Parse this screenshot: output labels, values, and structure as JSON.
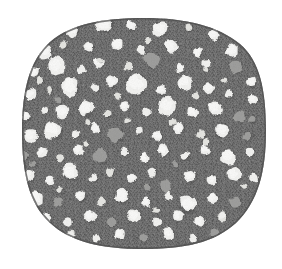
{
  "figure": {
    "title": "Grayscale micrograph of a rounded specimen section",
    "background_color": "#ffffff",
    "canvas": {
      "width": 282,
      "height": 269
    }
  },
  "specimen": {
    "name": "specimen-body",
    "matrix_color": "#6f6f6f",
    "matrix_color_dark": "#5e5e5e",
    "matrix_color_light": "#7e7e7e",
    "edge_color": "#4d4d4d",
    "bounds": {
      "left": 22,
      "top": 18,
      "right": 266,
      "bottom": 249
    },
    "shape": "rounded-squircle",
    "texture": "fine-crosshatch-halftone-grain"
  },
  "legend_colors": {
    "inclusion_white": "#f2f2f0",
    "inclusion_offwhite": "#e4e4e0",
    "inclusion_gray": "#9e9e9c",
    "inclusion_gray_dark": "#8a8a88",
    "matrix": "#6f6f6f"
  },
  "chart_data": {
    "type": "scatter",
    "title": "Grayscale micrograph of a rounded specimen section",
    "subtitle": "",
    "xlabel": "",
    "ylabel": "",
    "xlim": [
      0,
      282
    ],
    "ylim": [
      0,
      269
    ],
    "grid": false,
    "legend_position": "none",
    "classes": [
      {
        "name": "white",
        "color": "#f2f2f0",
        "count": 96
      },
      {
        "name": "offwhite",
        "color": "#e4e4e0",
        "count": 22
      },
      {
        "name": "gray",
        "color": "#9e9e9c",
        "count": 21
      }
    ],
    "points": [
      {
        "x": 72,
        "y": 30,
        "r": 7.5,
        "class": "white"
      },
      {
        "x": 104,
        "y": 24,
        "r": 9.0,
        "class": "white"
      },
      {
        "x": 131,
        "y": 26,
        "r": 5.0,
        "class": "white"
      },
      {
        "x": 160,
        "y": 29,
        "r": 8.0,
        "class": "white"
      },
      {
        "x": 188,
        "y": 27,
        "r": 4.0,
        "class": "offwhite"
      },
      {
        "x": 214,
        "y": 35,
        "r": 5.5,
        "class": "white"
      },
      {
        "x": 45,
        "y": 52,
        "r": 7.0,
        "class": "white"
      },
      {
        "x": 64,
        "y": 45,
        "r": 4.0,
        "class": "offwhite"
      },
      {
        "x": 89,
        "y": 47,
        "r": 5.0,
        "class": "white"
      },
      {
        "x": 117,
        "y": 44,
        "r": 6.0,
        "class": "white"
      },
      {
        "x": 141,
        "y": 50,
        "r": 4.5,
        "class": "white"
      },
      {
        "x": 171,
        "y": 46,
        "r": 7.5,
        "class": "white"
      },
      {
        "x": 198,
        "y": 52,
        "r": 5.0,
        "class": "white"
      },
      {
        "x": 232,
        "y": 50,
        "r": 6.5,
        "class": "white"
      },
      {
        "x": 34,
        "y": 72,
        "r": 5.5,
        "class": "white"
      },
      {
        "x": 56,
        "y": 66,
        "r": 9.5,
        "class": "white"
      },
      {
        "x": 82,
        "y": 70,
        "r": 4.0,
        "class": "white"
      },
      {
        "x": 99,
        "y": 62,
        "r": 5.5,
        "class": "white"
      },
      {
        "x": 128,
        "y": 66,
        "r": 4.5,
        "class": "offwhite"
      },
      {
        "x": 152,
        "y": 60,
        "r": 8.5,
        "class": "gray"
      },
      {
        "x": 180,
        "y": 68,
        "r": 5.0,
        "class": "white"
      },
      {
        "x": 206,
        "y": 63,
        "r": 4.5,
        "class": "white"
      },
      {
        "x": 236,
        "y": 67,
        "r": 7.0,
        "class": "gray"
      },
      {
        "x": 252,
        "y": 82,
        "r": 5.0,
        "class": "white"
      },
      {
        "x": 30,
        "y": 94,
        "r": 6.0,
        "class": "white"
      },
      {
        "x": 50,
        "y": 90,
        "r": 4.0,
        "class": "offwhite"
      },
      {
        "x": 70,
        "y": 86,
        "r": 10.0,
        "class": "white"
      },
      {
        "x": 95,
        "y": 88,
        "r": 4.5,
        "class": "white"
      },
      {
        "x": 112,
        "y": 82,
        "r": 5.5,
        "class": "white"
      },
      {
        "x": 136,
        "y": 84,
        "r": 11.0,
        "class": "white"
      },
      {
        "x": 161,
        "y": 90,
        "r": 5.0,
        "class": "white"
      },
      {
        "x": 185,
        "y": 83,
        "r": 7.0,
        "class": "white"
      },
      {
        "x": 209,
        "y": 88,
        "r": 5.5,
        "class": "white"
      },
      {
        "x": 229,
        "y": 94,
        "r": 4.5,
        "class": "white"
      },
      {
        "x": 253,
        "y": 100,
        "r": 5.5,
        "class": "white"
      },
      {
        "x": 26,
        "y": 116,
        "r": 5.0,
        "class": "white"
      },
      {
        "x": 45,
        "y": 110,
        "r": 4.0,
        "class": "white"
      },
      {
        "x": 62,
        "y": 112,
        "r": 6.5,
        "class": "white"
      },
      {
        "x": 86,
        "y": 108,
        "r": 8.0,
        "class": "white"
      },
      {
        "x": 108,
        "y": 114,
        "r": 4.0,
        "class": "offwhite"
      },
      {
        "x": 124,
        "y": 106,
        "r": 5.0,
        "class": "white"
      },
      {
        "x": 146,
        "y": 112,
        "r": 4.5,
        "class": "white"
      },
      {
        "x": 167,
        "y": 106,
        "r": 9.0,
        "class": "white"
      },
      {
        "x": 192,
        "y": 112,
        "r": 5.5,
        "class": "white"
      },
      {
        "x": 215,
        "y": 108,
        "r": 7.5,
        "class": "white"
      },
      {
        "x": 240,
        "y": 116,
        "r": 6.5,
        "class": "gray"
      },
      {
        "x": 31,
        "y": 136,
        "r": 7.0,
        "class": "white"
      },
      {
        "x": 53,
        "y": 130,
        "r": 9.0,
        "class": "white"
      },
      {
        "x": 76,
        "y": 134,
        "r": 4.5,
        "class": "white"
      },
      {
        "x": 96,
        "y": 128,
        "r": 5.5,
        "class": "white"
      },
      {
        "x": 116,
        "y": 134,
        "r": 8.5,
        "class": "gray"
      },
      {
        "x": 139,
        "y": 130,
        "r": 4.0,
        "class": "white"
      },
      {
        "x": 158,
        "y": 136,
        "r": 5.0,
        "class": "white"
      },
      {
        "x": 179,
        "y": 128,
        "r": 6.0,
        "class": "white"
      },
      {
        "x": 201,
        "y": 134,
        "r": 4.5,
        "class": "offwhite"
      },
      {
        "x": 222,
        "y": 130,
        "r": 7.5,
        "class": "white"
      },
      {
        "x": 247,
        "y": 136,
        "r": 5.0,
        "class": "gray"
      },
      {
        "x": 24,
        "y": 156,
        "r": 4.5,
        "class": "gray"
      },
      {
        "x": 42,
        "y": 152,
        "r": 5.0,
        "class": "white"
      },
      {
        "x": 60,
        "y": 158,
        "r": 4.0,
        "class": "offwhite"
      },
      {
        "x": 78,
        "y": 150,
        "r": 5.5,
        "class": "white"
      },
      {
        "x": 100,
        "y": 156,
        "r": 7.5,
        "class": "gray"
      },
      {
        "x": 124,
        "y": 152,
        "r": 4.0,
        "class": "white"
      },
      {
        "x": 144,
        "y": 158,
        "r": 5.0,
        "class": "white"
      },
      {
        "x": 163,
        "y": 150,
        "r": 6.0,
        "class": "white"
      },
      {
        "x": 185,
        "y": 156,
        "r": 4.5,
        "class": "white"
      },
      {
        "x": 205,
        "y": 150,
        "r": 5.5,
        "class": "white"
      },
      {
        "x": 228,
        "y": 156,
        "r": 8.0,
        "class": "white"
      },
      {
        "x": 250,
        "y": 152,
        "r": 4.5,
        "class": "white"
      },
      {
        "x": 28,
        "y": 176,
        "r": 6.0,
        "class": "white"
      },
      {
        "x": 50,
        "y": 180,
        "r": 5.0,
        "class": "white"
      },
      {
        "x": 70,
        "y": 172,
        "r": 8.5,
        "class": "white"
      },
      {
        "x": 93,
        "y": 178,
        "r": 4.0,
        "class": "white"
      },
      {
        "x": 110,
        "y": 172,
        "r": 4.5,
        "class": "offwhite"
      },
      {
        "x": 131,
        "y": 178,
        "r": 5.0,
        "class": "white"
      },
      {
        "x": 152,
        "y": 172,
        "r": 4.5,
        "class": "white"
      },
      {
        "x": 166,
        "y": 186,
        "r": 6.0,
        "class": "gray"
      },
      {
        "x": 190,
        "y": 176,
        "r": 6.5,
        "class": "white"
      },
      {
        "x": 212,
        "y": 180,
        "r": 5.0,
        "class": "white"
      },
      {
        "x": 234,
        "y": 174,
        "r": 7.0,
        "class": "white"
      },
      {
        "x": 254,
        "y": 178,
        "r": 4.5,
        "class": "white"
      },
      {
        "x": 36,
        "y": 198,
        "r": 7.5,
        "class": "white"
      },
      {
        "x": 58,
        "y": 202,
        "r": 5.0,
        "class": "gray"
      },
      {
        "x": 80,
        "y": 196,
        "r": 6.0,
        "class": "white"
      },
      {
        "x": 102,
        "y": 202,
        "r": 4.5,
        "class": "offwhite"
      },
      {
        "x": 122,
        "y": 196,
        "r": 8.0,
        "class": "white"
      },
      {
        "x": 146,
        "y": 202,
        "r": 5.0,
        "class": "white"
      },
      {
        "x": 168,
        "y": 196,
        "r": 4.5,
        "class": "white"
      },
      {
        "x": 188,
        "y": 204,
        "r": 9.0,
        "class": "white"
      },
      {
        "x": 213,
        "y": 198,
        "r": 5.5,
        "class": "white"
      },
      {
        "x": 236,
        "y": 202,
        "r": 6.0,
        "class": "gray"
      },
      {
        "x": 46,
        "y": 218,
        "r": 5.5,
        "class": "white"
      },
      {
        "x": 68,
        "y": 222,
        "r": 4.5,
        "class": "white"
      },
      {
        "x": 90,
        "y": 216,
        "r": 6.5,
        "class": "white"
      },
      {
        "x": 112,
        "y": 222,
        "r": 5.0,
        "class": "gray"
      },
      {
        "x": 134,
        "y": 216,
        "r": 7.0,
        "class": "white"
      },
      {
        "x": 157,
        "y": 222,
        "r": 4.5,
        "class": "white"
      },
      {
        "x": 178,
        "y": 216,
        "r": 5.5,
        "class": "white"
      },
      {
        "x": 200,
        "y": 222,
        "r": 6.0,
        "class": "white"
      },
      {
        "x": 222,
        "y": 216,
        "r": 5.0,
        "class": "offwhite"
      },
      {
        "x": 70,
        "y": 236,
        "r": 5.0,
        "class": "offwhite"
      },
      {
        "x": 96,
        "y": 238,
        "r": 4.5,
        "class": "white"
      },
      {
        "x": 120,
        "y": 234,
        "r": 5.5,
        "class": "white"
      },
      {
        "x": 144,
        "y": 238,
        "r": 4.0,
        "class": "gray"
      },
      {
        "x": 168,
        "y": 234,
        "r": 6.0,
        "class": "white"
      },
      {
        "x": 193,
        "y": 238,
        "r": 4.5,
        "class": "white"
      },
      {
        "x": 214,
        "y": 232,
        "r": 5.0,
        "class": "gray"
      },
      {
        "x": 40,
        "y": 80,
        "r": 3.5,
        "class": "offwhite"
      },
      {
        "x": 148,
        "y": 40,
        "r": 3.0,
        "class": "offwhite"
      },
      {
        "x": 196,
        "y": 96,
        "r": 3.5,
        "class": "offwhite"
      },
      {
        "x": 88,
        "y": 122,
        "r": 3.0,
        "class": "offwhite"
      },
      {
        "x": 172,
        "y": 122,
        "r": 3.5,
        "class": "offwhite"
      },
      {
        "x": 60,
        "y": 190,
        "r": 3.0,
        "class": "offwhite"
      },
      {
        "x": 148,
        "y": 188,
        "r": 3.5,
        "class": "gray"
      },
      {
        "x": 244,
        "y": 186,
        "r": 3.0,
        "class": "offwhite"
      },
      {
        "x": 206,
        "y": 70,
        "r": 3.0,
        "class": "offwhite"
      },
      {
        "x": 118,
        "y": 96,
        "r": 3.5,
        "class": "offwhite"
      },
      {
        "x": 58,
        "y": 100,
        "r": 3.0,
        "class": "gray"
      },
      {
        "x": 175,
        "y": 164,
        "r": 3.5,
        "class": "gray"
      },
      {
        "x": 33,
        "y": 164,
        "r": 3.0,
        "class": "gray"
      },
      {
        "x": 252,
        "y": 120,
        "r": 3.5,
        "class": "gray"
      },
      {
        "x": 127,
        "y": 120,
        "r": 3.0,
        "class": "offwhite"
      },
      {
        "x": 86,
        "y": 144,
        "r": 3.0,
        "class": "offwhite"
      },
      {
        "x": 206,
        "y": 142,
        "r": 3.5,
        "class": "offwhite"
      },
      {
        "x": 156,
        "y": 210,
        "r": 3.0,
        "class": "offwhite"
      },
      {
        "x": 100,
        "y": 60,
        "r": 3.0,
        "class": "offwhite"
      },
      {
        "x": 224,
        "y": 80,
        "r": 3.0,
        "class": "offwhite"
      }
    ]
  }
}
